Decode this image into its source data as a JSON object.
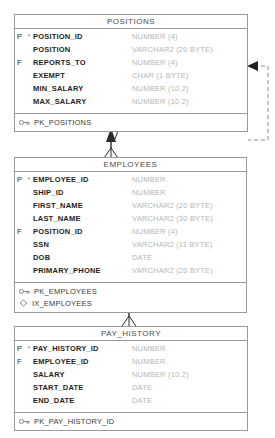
{
  "diagram": {
    "type": "entity-relationship-diagram",
    "notation": "barker",
    "colors": {
      "border": "#9a9a9a",
      "column_name": "#1f1f1f",
      "datatype": "#b6b6b6",
      "title": "#4a4a4a",
      "connector": "#2b2b2b",
      "background": "#ffffff"
    }
  },
  "entities": [
    {
      "name": "POSITIONS",
      "columns": [
        {
          "flag": "P",
          "required": "*",
          "name": "POSITION_ID",
          "type": "NUMBER (4)"
        },
        {
          "flag": "",
          "required": "",
          "name": "POSITION",
          "type": "VARCHAR2 (20 BYTE)"
        },
        {
          "flag": "F",
          "required": "",
          "name": "REPORTS_TO",
          "type": "NUMBER (4)"
        },
        {
          "flag": "",
          "required": "",
          "name": "EXEMPT",
          "type": "CHAR (1 BYTE)"
        },
        {
          "flag": "",
          "required": "",
          "name": "MIN_SALARY",
          "type": "NUMBER (10,2)"
        },
        {
          "flag": "",
          "required": "",
          "name": "MAX_SALARY",
          "type": "NUMBER (10,2)"
        }
      ],
      "keys": [
        {
          "icon": "primary-key-icon",
          "label": "PK_POSITIONS"
        }
      ]
    },
    {
      "name": "EMPLOYEES",
      "columns": [
        {
          "flag": "P",
          "required": "*",
          "name": "EMPLOYEE_ID",
          "type": "NUMBER"
        },
        {
          "flag": "",
          "required": "",
          "name": "SHIP_ID",
          "type": "NUMBER"
        },
        {
          "flag": "",
          "required": "",
          "name": "FIRST_NAME",
          "type": "VARCHAR2 (20 BYTE)"
        },
        {
          "flag": "",
          "required": "",
          "name": "LAST_NAME",
          "type": "VARCHAR2 (30 BYTE)"
        },
        {
          "flag": "F",
          "required": "",
          "name": "POSITION_ID",
          "type": "NUMBER (4)"
        },
        {
          "flag": "",
          "required": "",
          "name": "SSN",
          "type": "VARCHAR2 (11 BYTE)"
        },
        {
          "flag": "",
          "required": "",
          "name": "DOB",
          "type": "DATE"
        },
        {
          "flag": "",
          "required": "",
          "name": "PRIMARY_PHONE",
          "type": "VARCHAR2 (20 BYTE)"
        }
      ],
      "keys": [
        {
          "icon": "primary-key-icon",
          "label": "PK_EMPLOYEES"
        },
        {
          "icon": "index-icon",
          "label": "IX_EMPLOYEES"
        }
      ]
    },
    {
      "name": "PAY_HISTORY",
      "columns": [
        {
          "flag": "P",
          "required": "*",
          "name": "PAY_HISTORY_ID",
          "type": "NUMBER"
        },
        {
          "flag": "F",
          "required": "",
          "name": "EMPLOYEE_ID",
          "type": "NUMBER"
        },
        {
          "flag": "",
          "required": "",
          "name": "SALARY",
          "type": "NUMBER (10,2)"
        },
        {
          "flag": "",
          "required": "",
          "name": "START_DATE",
          "type": "DATE"
        },
        {
          "flag": "",
          "required": "",
          "name": "END_DATE",
          "type": "DATE"
        }
      ],
      "keys": [
        {
          "icon": "primary-key-icon",
          "label": "PK_PAY_HISTORY_ID"
        }
      ]
    }
  ],
  "relationships": [
    {
      "name": "employees-to-positions",
      "from": "EMPLOYEES",
      "to": "POSITIONS",
      "style": "crows-foot"
    },
    {
      "name": "positions-reports-to-self",
      "from": "POSITIONS",
      "to": "POSITIONS",
      "style": "dashed-arrow"
    },
    {
      "name": "pay-history-to-employees",
      "from": "PAY_HISTORY",
      "to": "EMPLOYEES",
      "style": "crows-foot"
    }
  ]
}
